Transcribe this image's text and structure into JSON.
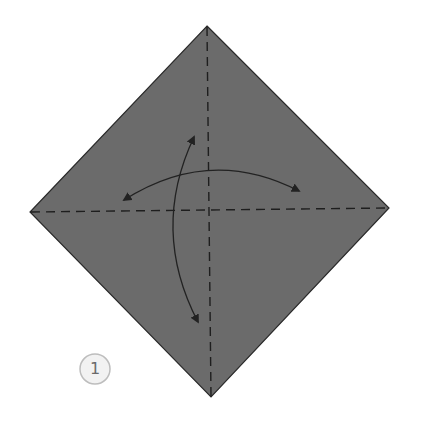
{
  "diagram": {
    "type": "origami-instruction-step",
    "step_number": "1",
    "paper": {
      "color": "#6b6b6b",
      "outline": "#2a2a2a"
    },
    "crease_lines": [
      {
        "name": "vertical-valley-fold",
        "style": "dashed"
      },
      {
        "name": "horizontal-valley-fold",
        "style": "dashed"
      }
    ],
    "arrows": [
      {
        "name": "fold-unfold-horizontal",
        "direction": "left-right, double-headed"
      },
      {
        "name": "fold-unfold-vertical",
        "direction": "up-down, double-headed"
      }
    ],
    "step_badge": {
      "fill": "#f2f2f2",
      "stroke": "#bdbdbd"
    }
  }
}
